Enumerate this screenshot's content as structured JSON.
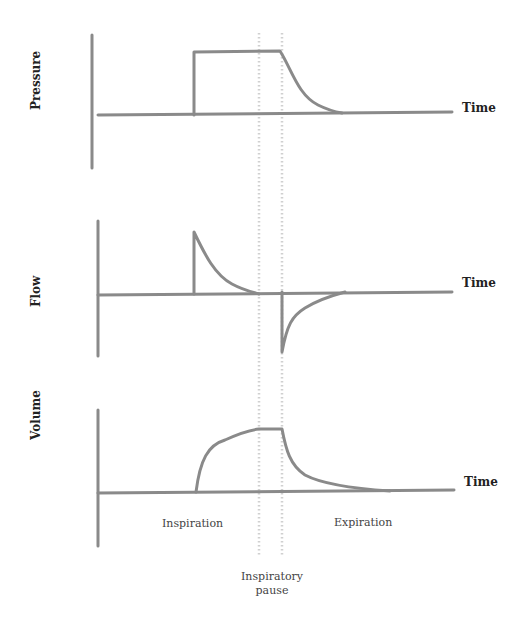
{
  "diagram": {
    "title": "",
    "panels": [
      {
        "id": "pressure",
        "ylabel": "Pressure",
        "xlabel": "Time"
      },
      {
        "id": "flow",
        "ylabel": "Flow",
        "xlabel": "Time"
      },
      {
        "id": "volume",
        "ylabel": "Volume",
        "xlabel": "Time"
      }
    ],
    "phases": {
      "inspiration": "Inspiration",
      "expiration": "Expiration",
      "pause_line1": "Inspiratory",
      "pause_line2": "pause"
    },
    "colors": {
      "trace": "#8a8a8a",
      "pause_markers": "#d0d0d0",
      "text": "#222222"
    }
  }
}
